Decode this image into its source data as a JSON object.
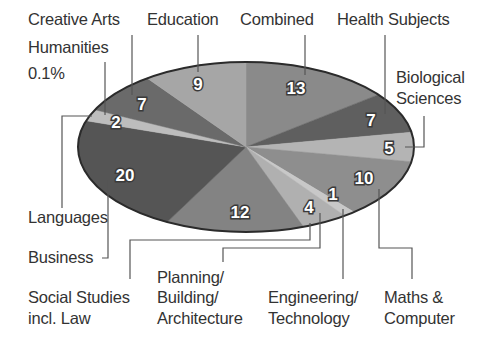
{
  "chart_data": {
    "type": "pie",
    "title": "",
    "style": "3d-ellipse, grayscale",
    "order": "clockwise from 12 o'clock",
    "slices": [
      {
        "label": "Combined",
        "value": 13,
        "color": "#8a8a8a"
      },
      {
        "label": "Health Subjects",
        "value": 7,
        "color": "#5f5f5f"
      },
      {
        "label": "Biological Sciences",
        "value": 5,
        "color": "#b4b4b4"
      },
      {
        "label": "Maths & Computer",
        "value": 10,
        "color": "#8e8e8e"
      },
      {
        "label": "Engineering/ Technology",
        "value": 1,
        "color": "#c8c8c8"
      },
      {
        "label": "Planning/ Building/ Architecture",
        "value": 4,
        "color": "#b0b0b0"
      },
      {
        "label": "Social Studies incl. Law",
        "value": 12,
        "color": "#838383"
      },
      {
        "label": "Business",
        "value": 20,
        "color": "#555555"
      },
      {
        "label": "Languages",
        "value": 0,
        "color": "#555555"
      },
      {
        "label": "Humanities",
        "value": 2,
        "color": "#bdbdbd"
      },
      {
        "label": "Creative Arts",
        "value": 7,
        "color": "#6a6a6a"
      },
      {
        "label": "Education",
        "value": 9,
        "color": "#a6a6a6"
      }
    ],
    "annotations": [
      "Humanities 0.1%"
    ],
    "legend": "none (leader-line callouts)"
  },
  "labels": {
    "creative_arts": "Creative Arts",
    "education": "Education",
    "combined": "Combined",
    "health": "Health Subjects",
    "humanities": "Humanities",
    "humanities_pct": "0.1%",
    "bio_1": "Biological",
    "bio_2": "Sciences",
    "languages": "Languages",
    "business": "Business",
    "social_1": "Social Studies",
    "social_2": "incl. Law",
    "planning_1": "Planning/",
    "planning_2": "Building/",
    "planning_3": "Architecture",
    "eng_1": "Engineering/",
    "eng_2": "Technology",
    "maths_1": "Maths &",
    "maths_2": "Computer"
  },
  "values": {
    "combined": "13",
    "health": "7",
    "bio": "5",
    "maths": "10",
    "eng": "1",
    "planning": "4",
    "social": "12",
    "business": "20",
    "humanities": "2",
    "creative": "7",
    "education": "9"
  }
}
